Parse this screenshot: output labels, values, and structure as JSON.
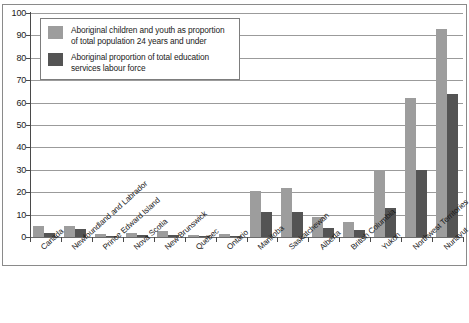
{
  "chart_data": {
    "type": "bar",
    "title": "",
    "xlabel": "",
    "ylabel": "",
    "ylim": [
      0,
      100
    ],
    "yticks": [
      0,
      10,
      20,
      30,
      40,
      50,
      60,
      70,
      80,
      90,
      100
    ],
    "grid": true,
    "legend_position": "top-left",
    "categories": [
      "Canada",
      "Newfoundland and Labrador",
      "Prince Edward Island",
      "Nova Scotia",
      "New Brunswick",
      "Quebec",
      "Ontario",
      "Manitoba",
      "Saskatchewan",
      "Alberta",
      "British Columbia",
      "Yukon",
      "Northwest Territories",
      "Nunavut"
    ],
    "series": [
      {
        "name": "Aboriginal children and youth as proportion of total population 24 years and under",
        "color": "#9d9d9d",
        "values": [
          5,
          5,
          1.5,
          2,
          2.5,
          1,
          1.5,
          20.5,
          22,
          9,
          6.5,
          30,
          62,
          93
        ]
      },
      {
        "name": "Aboriginal proportion of total education services labour force",
        "color": "#545454",
        "values": [
          2,
          3.5,
          0.3,
          1,
          1,
          0.3,
          0.5,
          11,
          11,
          4,
          3,
          13,
          30,
          64
        ]
      }
    ]
  },
  "legend": {
    "entries": [
      {
        "swatch": "light",
        "line1": "Aboriginal children and youth as proportion",
        "line2": "of total population 24 years and under"
      },
      {
        "swatch": "dark",
        "line1": "Aboriginal proportion of total education",
        "line2": "services labour force"
      }
    ]
  }
}
